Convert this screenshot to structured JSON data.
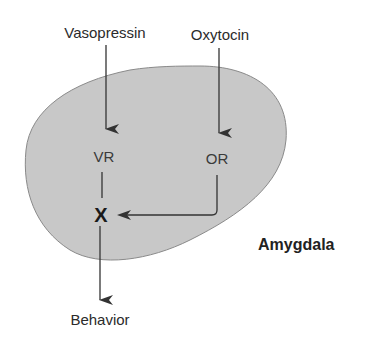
{
  "diagram": {
    "region": {
      "label": "Amygdala",
      "fill_color": "#c8c8c8",
      "stroke_color": "#8a8a8a"
    },
    "inputs": [
      {
        "id": "vasopressin",
        "label": "Vasopressin"
      },
      {
        "id": "oxytocin",
        "label": "Oxytocin"
      }
    ],
    "receptors": [
      {
        "id": "vr",
        "label": "VR"
      },
      {
        "id": "or",
        "label": "OR"
      }
    ],
    "integration_node": {
      "label": "X"
    },
    "output": {
      "label": "Behavior"
    },
    "edges": [
      {
        "from": "Vasopressin",
        "to": "VR",
        "arrow": true
      },
      {
        "from": "Oxytocin",
        "to": "OR",
        "arrow": true
      },
      {
        "from": "VR",
        "to": "X",
        "arrow": false
      },
      {
        "from": "OR",
        "to": "X",
        "arrow": true
      },
      {
        "from": "X",
        "to": "Behavior",
        "arrow": true
      }
    ],
    "line_color": "#333333"
  }
}
